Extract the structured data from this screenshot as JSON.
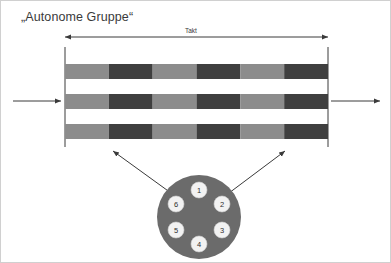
{
  "diagram": {
    "title": "„Autonome Gruppe“",
    "takt_label": "Takt",
    "colors": {
      "light_segment": "#8c8c8c",
      "dark_segment": "#3f3f3f",
      "circle_fill": "#6b6b6b",
      "node_fill": "#f2f2f2",
      "line": "#3a3a3a",
      "background": "#ffffff",
      "border": "#d0d0d0",
      "text": "#3a3a3a"
    },
    "takt_arrow": {
      "x_start": 64,
      "x_end": 327,
      "y": 36,
      "double_headed": true
    },
    "boundary_lines": [
      {
        "name": "left-boundary",
        "x": 64,
        "y_top": 46,
        "y_bottom": 146
      },
      {
        "name": "right-boundary",
        "x": 327,
        "y_top": 46,
        "y_bottom": 146
      }
    ],
    "input_arrow": {
      "x_start": 12,
      "x_end": 60,
      "y": 100,
      "label": ""
    },
    "output_arrow": {
      "x_start": 330,
      "x_end": 379,
      "y": 100,
      "label": ""
    },
    "bars": [
      {
        "name": "bar-row-1",
        "y": 63,
        "height": 15,
        "segments": [
          "light",
          "dark",
          "light",
          "dark",
          "light",
          "dark"
        ]
      },
      {
        "name": "bar-row-2",
        "y": 93,
        "height": 15,
        "segments": [
          "light",
          "dark",
          "light",
          "dark",
          "light",
          "dark"
        ]
      },
      {
        "name": "bar-row-3",
        "y": 123,
        "height": 15,
        "segments": [
          "light",
          "dark",
          "light",
          "dark",
          "light",
          "dark"
        ]
      }
    ],
    "bar_extent": {
      "x_start": 64,
      "x_end": 327,
      "segment_count": 6
    },
    "group_circle": {
      "cx": 198,
      "cy": 216,
      "r": 42,
      "nodes": [
        {
          "label": "1",
          "cx": 198,
          "cy": 189,
          "r": 8
        },
        {
          "label": "2",
          "cx": 221,
          "cy": 203,
          "r": 8
        },
        {
          "label": "3",
          "cx": 221,
          "cy": 229,
          "r": 8
        },
        {
          "label": "4",
          "cx": 198,
          "cy": 243,
          "r": 8
        },
        {
          "label": "5",
          "cx": 175,
          "cy": 229,
          "r": 8
        },
        {
          "label": "6",
          "cx": 175,
          "cy": 203,
          "r": 8
        }
      ]
    },
    "connector_arrows": [
      {
        "name": "connector-arrow-left",
        "x_start": 170,
        "y_start": 192,
        "x_end": 112,
        "y_end": 150
      },
      {
        "name": "connector-arrow-right",
        "x_start": 228,
        "y_start": 192,
        "x_end": 284,
        "y_end": 150
      }
    ]
  }
}
